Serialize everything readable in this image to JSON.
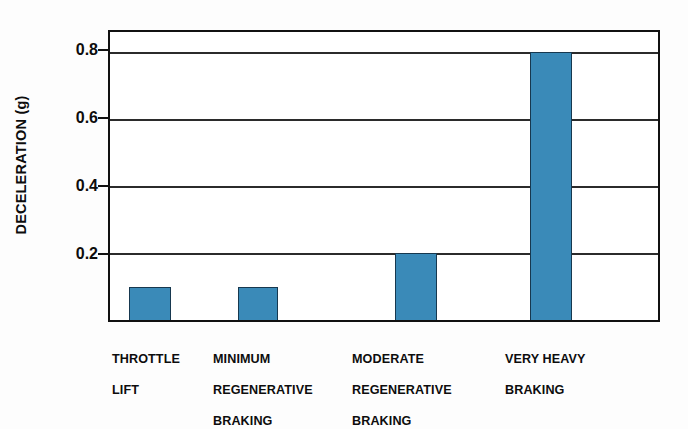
{
  "chart_data": {
    "type": "bar",
    "title": "",
    "xlabel": "",
    "ylabel": "DECELERATION (g)",
    "categories": [
      "THROTTLE\nLIFT",
      "MINIMUM\nREGENERATIVE\nBRAKING",
      "MODERATE\nREGENERATIVE\nBRAKING",
      "VERY HEAVY\nBRAKING"
    ],
    "values": [
      0.1,
      0.1,
      0.2,
      0.8
    ],
    "ylim": [
      0,
      0.86
    ],
    "yticks": [
      0.2,
      0.4,
      0.6,
      0.8
    ],
    "ytick_labels": [
      "0.2",
      "0.4",
      "0.6",
      "0.8"
    ],
    "grid": true,
    "legend": false,
    "bar_color": "#3a8ab8",
    "bar_edge_color": "#17384f",
    "axis_color": "#111111",
    "background_color": "#ffffff"
  },
  "axes": {
    "y_title": "DECELERATION (g)",
    "ticks": [
      {
        "label": "0.8",
        "value": 0.8
      },
      {
        "label": "0.6",
        "value": 0.6
      },
      {
        "label": "0.4",
        "value": 0.4
      },
      {
        "label": "0.2",
        "value": 0.2
      }
    ]
  },
  "x_categories": [
    {
      "line1": "THROTTLE",
      "line2": "LIFT",
      "line3": ""
    },
    {
      "line1": "MINIMUM",
      "line2": "REGENERATIVE",
      "line3": "BRAKING"
    },
    {
      "line1": "MODERATE",
      "line2": "REGENERATIVE",
      "line3": "BRAKING"
    },
    {
      "line1": "VERY HEAVY",
      "line2": "BRAKING",
      "line3": ""
    }
  ]
}
